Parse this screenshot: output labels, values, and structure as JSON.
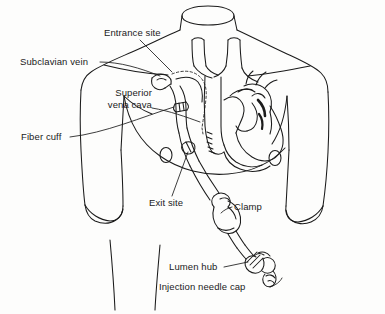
{
  "figure": {
    "background_color": "#fdfdfc",
    "ink_color": "#1b1b1b",
    "width": 385,
    "height": 314
  },
  "labels": {
    "entrance_site": "Entrance site",
    "subclavian_vein": "Subclavian vein",
    "superior_line1": "Superior",
    "superior_line2": "vena cava",
    "fiber_cuff": "Fiber cuff",
    "exit_site": "Exit site",
    "clamp": "Clamp",
    "lumen_hub": "Lumen hub",
    "injection_needle_cap": "Injection needle cap"
  },
  "anatomy_parts": [
    "neck",
    "right-shoulder",
    "left-shoulder",
    "right-arm",
    "left-arm",
    "chest-outline",
    "right-nipple",
    "left-nipple",
    "heart",
    "aortic-arch",
    "superior-vena-cava",
    "brachiocephalic-veins",
    "pulmonary-artery",
    "clavicle-right",
    "clavicle-left",
    "pectoral-fold"
  ],
  "device_parts": [
    "catheter-tube",
    "catheter-tip",
    "fiber-cuff-band",
    "exit-site-marker",
    "clamp-body",
    "lumen-hub",
    "injection-needle-cap"
  ]
}
